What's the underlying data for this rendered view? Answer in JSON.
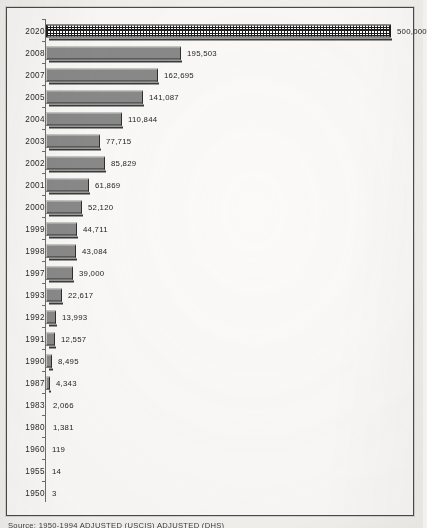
{
  "figure": {
    "frame_border_color": "#4a4a4a",
    "background_color": "#fbfaf8",
    "bar_fill_color": "#8a8a8a",
    "highlight_bar_pattern": "cross-hatch"
  },
  "caption": {
    "text": "Source:  1950-1994 ADJUSTED (USCIS) ADJUSTED (DHS)"
  },
  "chart_data": {
    "type": "bar",
    "orientation": "horizontal",
    "title": "",
    "xlabel": "",
    "ylabel": "",
    "grid": false,
    "legend": "none",
    "xlim": [
      0,
      500000
    ],
    "categories": [
      "2020",
      "2008",
      "2007",
      "2005",
      "2004",
      "2003",
      "2002",
      "2001",
      "2000",
      "1999",
      "1998",
      "1997",
      "1993",
      "1992",
      "1991",
      "1990",
      "1987",
      "1983",
      "1980",
      "1960",
      "1955",
      "1950"
    ],
    "values": [
      500000,
      195503,
      162695,
      141087,
      110844,
      77715,
      85829,
      61869,
      52120,
      44711,
      43084,
      39000,
      22617,
      13993,
      12557,
      8495,
      4343,
      2066,
      1381,
      119,
      14,
      3
    ],
    "labels": [
      "500,000",
      "195,503",
      "162,695",
      "141,087",
      "110,844",
      "77,715",
      "85,829",
      "61,869",
      "52,120",
      "44,711",
      "43,084",
      "39,000",
      "22,617",
      "13,993",
      "12,557",
      "8,495",
      "4,343",
      "2,066",
      "1,381",
      "119",
      "14",
      "3"
    ],
    "highlighted_category": "2020"
  }
}
